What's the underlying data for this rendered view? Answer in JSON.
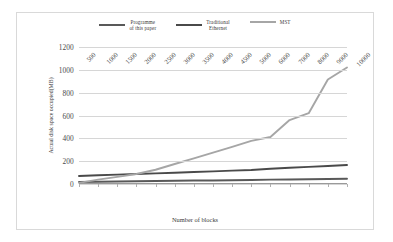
{
  "chart_data": {
    "type": "line",
    "title": "",
    "xlabel": "Number of blocks",
    "ylabel": "Actual disk space occupied(MB)",
    "categories": [
      "500",
      "1000",
      "1500",
      "2000",
      "2500",
      "3000",
      "3500",
      "4000",
      "4500",
      "5000",
      "6000",
      "7000",
      "8000",
      "9000",
      "10000"
    ],
    "ylim": [
      0,
      1200
    ],
    "yticks": [
      "0",
      "200",
      "400",
      "600",
      "800",
      "1000",
      "1200"
    ],
    "grid": true,
    "legend_position": "top",
    "series": [
      {
        "name": "Programme\nof this paper",
        "plain_name": "Programme of this paper",
        "color": "#595959",
        "values": [
          18,
          20,
          22,
          24,
          26,
          28,
          30,
          31,
          33,
          35,
          38,
          40,
          42,
          44,
          46
        ]
      },
      {
        "name": "Traditional\nEthernet",
        "plain_name": "Traditional Ethernet",
        "color": "#4a4a4a",
        "values": [
          70,
          76,
          82,
          88,
          93,
          99,
          105,
          111,
          117,
          123,
          133,
          142,
          150,
          158,
          166
        ]
      },
      {
        "name": "MST",
        "plain_name": "MST",
        "color": "#a6a6a6",
        "values": [
          10,
          38,
          62,
          88,
          125,
          175,
          225,
          275,
          325,
          378,
          412,
          560,
          620,
          915,
          1020
        ]
      }
    ]
  }
}
